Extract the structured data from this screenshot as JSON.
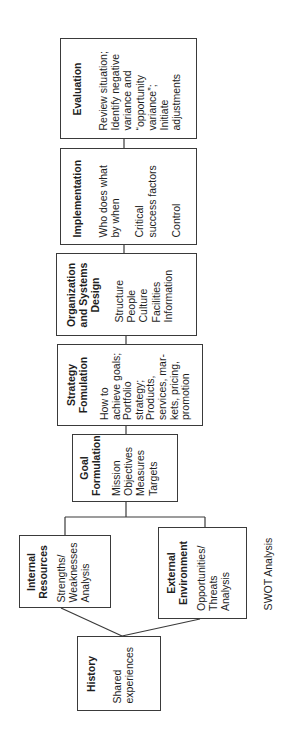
{
  "diagram": {
    "caption": "SWOT Analysis",
    "boxes": {
      "evaluation": {
        "title": "Evaluation",
        "lines": [
          "Review situation;",
          "Identify negative",
          "variance and",
          "“opportunity",
          "variance”;",
          "Initiate",
          "adjustments"
        ]
      },
      "implementation": {
        "title": "Implementation",
        "lines": [
          "Who does what",
          "by when",
          "",
          "Critical",
          "success factors",
          "",
          "Control"
        ]
      },
      "organization": {
        "title_lines": [
          "Organization",
          "and Systems",
          "Design"
        ],
        "lines": [
          "Structure",
          "People",
          "Culture",
          "Facilities",
          "Information"
        ]
      },
      "strategy": {
        "title_lines": [
          "Strategy",
          "Fomulation"
        ],
        "lines": [
          "How to",
          "achieve goals;",
          "Portfolio",
          "strategy;",
          "Products,",
          "services, mar-",
          "kets, pricing,",
          "promotion"
        ]
      },
      "goal": {
        "title_lines": [
          "Goal",
          "Formulation"
        ],
        "lines": [
          "Mission",
          "Objectives",
          "Measures",
          "Targets"
        ]
      },
      "internal": {
        "title_lines": [
          "Internal",
          "Resources"
        ],
        "lines": [
          "Strengths/",
          "Weaknesses",
          "Analysis"
        ]
      },
      "external": {
        "title_lines": [
          "External",
          "Environment"
        ],
        "lines": [
          "Opportunities/",
          "Threats",
          "Analysis"
        ]
      },
      "history": {
        "title": "History",
        "lines": [
          "Shared",
          "experiences"
        ]
      }
    },
    "colors": {
      "line": "#3a3a3a",
      "text": "#1e1e1e",
      "background": "#ffffff"
    }
  }
}
